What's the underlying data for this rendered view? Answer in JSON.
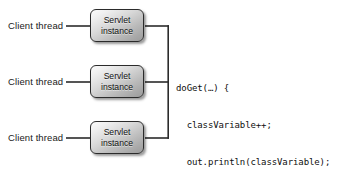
{
  "figure": {
    "type": "diagram",
    "background_color": "#ffffff",
    "stroke_color": "#2b2b2b"
  },
  "threads": [
    {
      "label": "Client thread"
    },
    {
      "label": "Client thread"
    },
    {
      "label": "Client thread"
    }
  ],
  "servlets": [
    {
      "line1": "Servlet",
      "line2": "instance"
    },
    {
      "line1": "Servlet",
      "line2": "instance"
    },
    {
      "line1": "Servlet",
      "line2": "instance"
    }
  ],
  "code": {
    "lines": [
      "doGet(…) {",
      "  classVariable++;",
      "  out.println(classVariable);",
      "}"
    ]
  }
}
